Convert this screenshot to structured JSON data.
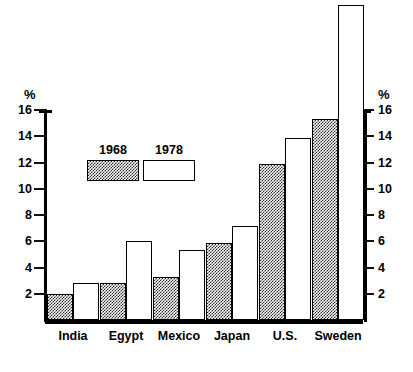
{
  "chart_data": {
    "type": "bar",
    "title": "",
    "subtitle": "",
    "xlabel": "",
    "ylabel": "%",
    "ylabel_right": "%",
    "ylim": [
      0,
      16
    ],
    "ytick_values": [
      2,
      4,
      6,
      8,
      10,
      12,
      14,
      16
    ],
    "ytick_labels": [
      "2",
      "4",
      "6",
      "8",
      "10",
      "12",
      "14",
      "16"
    ],
    "grid": false,
    "legend_position": "inside-upper-left",
    "categories": [
      "India",
      "Egypt",
      "Mexico",
      "Japan",
      "U.S.",
      "Sweden"
    ],
    "series": [
      {
        "name": "1968",
        "style": "hatched",
        "values": [
          2.0,
          2.8,
          3.3,
          5.9,
          11.9,
          15.3
        ]
      },
      {
        "name": "1978",
        "style": "blank",
        "values": [
          2.8,
          6.0,
          5.3,
          7.2,
          13.9,
          24.0
        ]
      }
    ]
  },
  "axis": {
    "unit_symbol": "%",
    "ticks": [
      {
        "value": 16,
        "label": "16"
      },
      {
        "value": 14,
        "label": "14"
      },
      {
        "value": 12,
        "label": "12"
      },
      {
        "value": 10,
        "label": "10"
      },
      {
        "value": 8,
        "label": "8"
      },
      {
        "value": 6,
        "label": "6"
      },
      {
        "value": 4,
        "label": "4"
      },
      {
        "value": 2,
        "label": "2"
      }
    ]
  },
  "legend": {
    "items": [
      {
        "label": "1968",
        "style": "hatched"
      },
      {
        "label": "1978",
        "style": "blank"
      }
    ]
  }
}
